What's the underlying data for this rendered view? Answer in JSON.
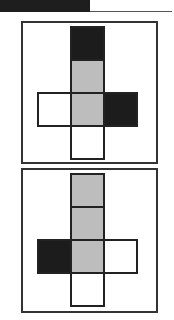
{
  "diagram": {
    "colors": {
      "black": "#1c1c1c",
      "gray": "#bdbdbd",
      "white": "#ffffff",
      "border": "#222222"
    },
    "panels": [
      {
        "id": "net-1",
        "cells": [
          {
            "col": 1,
            "row": 0,
            "fill": "black"
          },
          {
            "col": 1,
            "row": 1,
            "fill": "gray"
          },
          {
            "col": 0,
            "row": 2,
            "fill": "white"
          },
          {
            "col": 1,
            "row": 2,
            "fill": "gray"
          },
          {
            "col": 2,
            "row": 2,
            "fill": "black"
          },
          {
            "col": 1,
            "row": 3,
            "fill": "white"
          }
        ]
      },
      {
        "id": "net-2",
        "cells": [
          {
            "col": 1,
            "row": 0,
            "fill": "gray"
          },
          {
            "col": 1,
            "row": 1,
            "fill": "gray"
          },
          {
            "col": 0,
            "row": 2,
            "fill": "black"
          },
          {
            "col": 1,
            "row": 2,
            "fill": "gray"
          },
          {
            "col": 2,
            "row": 2,
            "fill": "white"
          },
          {
            "col": 1,
            "row": 3,
            "fill": "white"
          }
        ]
      }
    ]
  }
}
